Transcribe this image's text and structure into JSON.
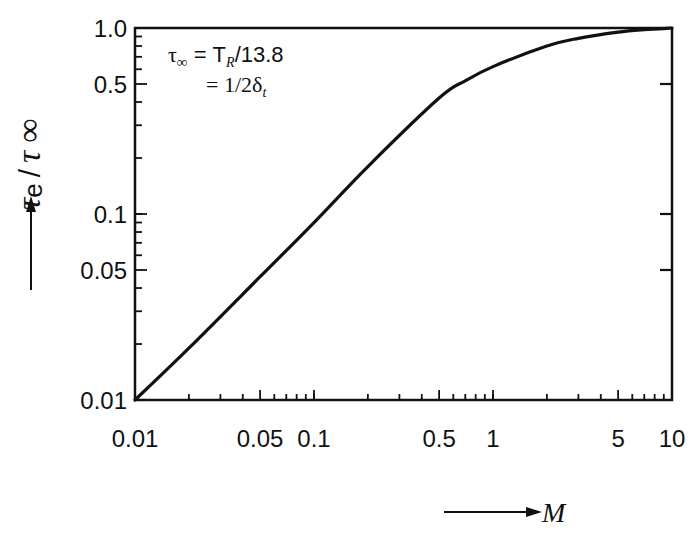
{
  "chart_data": {
    "type": "line",
    "title": "",
    "xlabel": "M",
    "ylabel": "τe / τ∞",
    "xscale": "log",
    "yscale": "log",
    "xlim": [
      0.01,
      10
    ],
    "ylim": [
      0.01,
      1.0
    ],
    "grid": false,
    "legend": null,
    "x_tick_labels": [
      "0.01",
      "0.05",
      "0.1",
      "0.5",
      "1",
      "5",
      "10"
    ],
    "y_tick_labels": [
      "0.01",
      "0.05",
      "0.1",
      "0.5",
      "1.0"
    ],
    "annotations": [
      "τ∞ = T_R/13.8",
      "= 1/2δ_t"
    ],
    "series": [
      {
        "name": "τe/τ∞",
        "x": [
          0.01,
          0.02,
          0.05,
          0.1,
          0.2,
          0.5,
          0.7,
          1,
          2,
          3,
          5,
          7,
          10
        ],
        "y": [
          0.01,
          0.019,
          0.046,
          0.09,
          0.18,
          0.42,
          0.52,
          0.62,
          0.8,
          0.88,
          0.95,
          0.98,
          1.0
        ]
      }
    ]
  },
  "labels": {
    "y_axis_title_main": "τ",
    "y_axis_title_sub": "e",
    "y_axis_title_sep": "/",
    "y_axis_title_den": "τ",
    "y_axis_title_inf": "∞",
    "x_axis_title": "M",
    "annotation_line1_prefix": "τ",
    "annotation_line1_sub": "∞",
    "annotation_line1_rest": " = T",
    "annotation_line1_sub2": "R",
    "annotation_line1_tail": "/13.8",
    "annotation_line2": "= 1/2δ",
    "annotation_line2_sub": "t"
  }
}
